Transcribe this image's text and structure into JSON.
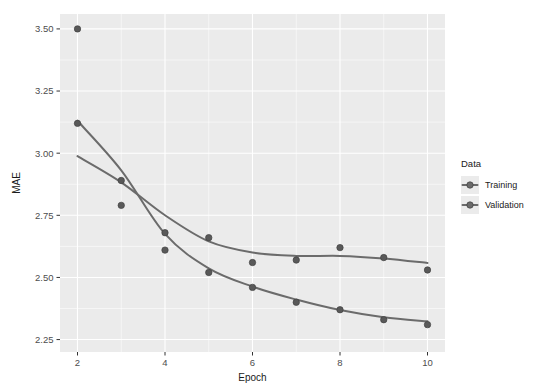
{
  "chart_data": {
    "type": "line",
    "title": "",
    "subtitle": "",
    "xlabel": "Epoch",
    "ylabel": "MAE",
    "xlim": [
      1.6,
      10.4
    ],
    "ylim": [
      2.2,
      3.56
    ],
    "xticks": [
      2,
      4,
      6,
      8,
      10
    ],
    "xticklabels": [
      "2",
      "4",
      "6",
      "8",
      "10"
    ],
    "yticks": [
      2.25,
      2.5,
      2.75,
      3.0,
      3.25,
      3.5
    ],
    "yticklabels": [
      "2.25",
      "2.50",
      "2.75",
      "3.00",
      "3.25",
      "3.50"
    ],
    "grid": true,
    "grid_color": "#ffffff",
    "panel_background": "#ebebeb",
    "plot_background": "#ffffff",
    "legend": {
      "title": "Data",
      "position": "right",
      "entries": [
        {
          "name": "Training",
          "color": "#6b6b6b"
        },
        {
          "name": "Validation",
          "color": "#6b6b6b"
        }
      ]
    },
    "x": [
      2,
      3,
      4,
      5,
      6,
      7,
      8,
      9,
      10
    ],
    "series": [
      {
        "name": "Training",
        "color": "#6b6b6b",
        "point_color": "#595959",
        "values": [
          3.5,
          2.79,
          2.61,
          2.52,
          2.46,
          2.4,
          2.37,
          2.33,
          2.31
        ]
      },
      {
        "name": "Validation",
        "color": "#6b6b6b",
        "point_color": "#595959",
        "values": [
          3.12,
          2.89,
          2.68,
          2.66,
          2.56,
          2.57,
          2.62,
          2.58,
          2.53
        ]
      }
    ],
    "smoothing": "loess",
    "point_size": 3.2,
    "line_width": 2.0
  },
  "ghost": {
    "top_text": ""
  }
}
